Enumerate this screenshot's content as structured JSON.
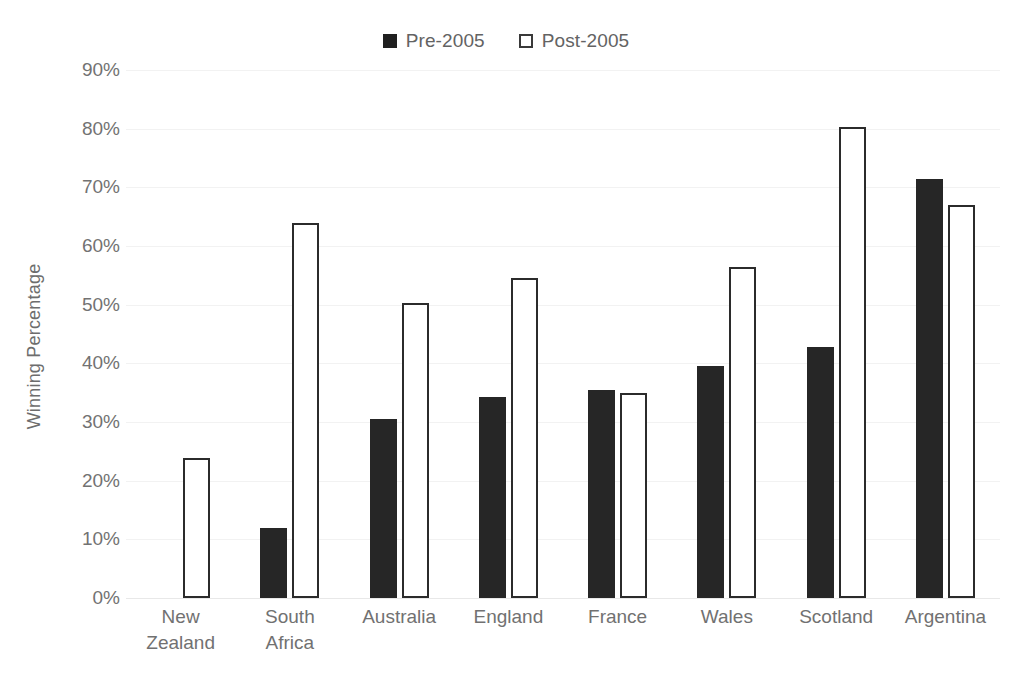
{
  "chart_data": {
    "type": "bar",
    "title": "",
    "xlabel": "",
    "ylabel": "Winning Percentage",
    "ylim": [
      0,
      90
    ],
    "grid": true,
    "legend_position": "top-center",
    "categories": [
      "New\nZealand",
      "South\nAfrica",
      "Australia",
      "England",
      "France",
      "Wales",
      "Scotland",
      "Argentina"
    ],
    "ytick_labels": [
      "90%",
      "80%",
      "70%",
      "60%",
      "50%",
      "40%",
      "30%",
      "20%",
      "10%",
      "0%"
    ],
    "ytick_values": [
      90,
      80,
      70,
      60,
      50,
      40,
      30,
      20,
      10,
      0
    ],
    "series": [
      {
        "name": "Pre-2005",
        "color": "#262626",
        "style": "filled",
        "values": [
          null,
          11.9,
          30.5,
          34.3,
          35.4,
          39.6,
          42.8,
          71.4
        ]
      },
      {
        "name": "Post-2005",
        "color": "#ffffff",
        "style": "outlined",
        "values": [
          23.9,
          63.9,
          50.3,
          54.5,
          35.0,
          56.4,
          80.3,
          67.0
        ]
      }
    ]
  },
  "legend": {
    "items": [
      {
        "label": "Pre-2005",
        "swatch": "filled-square-icon"
      },
      {
        "label": "Post-2005",
        "swatch": "outlined-square-icon"
      }
    ]
  },
  "axes": {
    "y_title": "Winning Percentage"
  }
}
